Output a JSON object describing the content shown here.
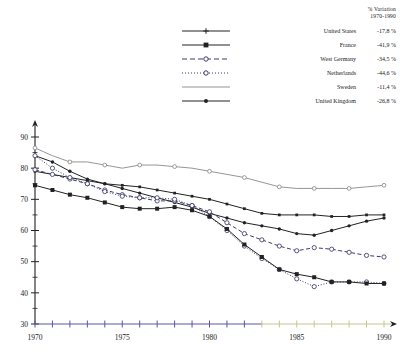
{
  "legend": {
    "header_line1": "% Variation",
    "header_line2": "1970-1990",
    "items": [
      {
        "name": "United States",
        "value": "-17,8 %",
        "style": "solid-plus",
        "color": "#222222"
      },
      {
        "name": "France",
        "value": "-41,9 %",
        "style": "solid-square",
        "color": "#222222"
      },
      {
        "name": "West Germany",
        "value": "-34,5 %",
        "style": "dashed-circle",
        "color": "#3b3b6b"
      },
      {
        "name": "Netherlands",
        "value": "-44,6 %",
        "style": "dotted-circle",
        "color": "#3b3b6b"
      },
      {
        "name": "Sweden",
        "value": "-11,4 %",
        "style": "thin-solid",
        "color": "#777777"
      },
      {
        "name": "United Kingdom",
        "value": "-26,8 %",
        "style": "solid-circle",
        "color": "#222222"
      }
    ]
  },
  "axes": {
    "y_ticks": [
      "90",
      "80",
      "70",
      "60",
      "50",
      "40",
      "30"
    ],
    "x_ticks": [
      "1970",
      "1975",
      "1980",
      "1985",
      "1990"
    ],
    "axis_color_left": "#5a57a8",
    "axis_color_right": "#c9c48a"
  },
  "chart_data": {
    "type": "line",
    "title": "",
    "xlabel": "",
    "ylabel": "",
    "xlim": [
      1970,
      1990
    ],
    "ylim": [
      30,
      90
    ],
    "grid": false,
    "legend_position": "top-right",
    "x": [
      1970,
      1971,
      1972,
      1973,
      1974,
      1975,
      1976,
      1977,
      1978,
      1979,
      1980,
      1981,
      1982,
      1983,
      1984,
      1985,
      1986,
      1987,
      1988,
      1989,
      1990
    ],
    "series": [
      {
        "name": "Sweden",
        "variation": "-11,4 %",
        "values": [
          86.5,
          84.0,
          82.0,
          82.0,
          81.0,
          80.0,
          81.0,
          81.0,
          80.5,
          80.0,
          79.0,
          78.0,
          77.0,
          75.5,
          74.0,
          73.5,
          73.5,
          73.5,
          73.5,
          74.0,
          74.5
        ]
      },
      {
        "name": "United States",
        "variation": "-17,8 %",
        "values": [
          79.0,
          78.0,
          77.0,
          76.0,
          75.0,
          74.5,
          74.0,
          73.0,
          72.0,
          71.0,
          70.0,
          68.5,
          67.0,
          65.5,
          65.0,
          65.0,
          65.0,
          64.5,
          64.5,
          65.0,
          65.0
        ]
      },
      {
        "name": "United Kingdom",
        "variation": "-26,8 %",
        "values": [
          84.0,
          82.0,
          79.0,
          76.5,
          75.0,
          73.5,
          72.0,
          70.5,
          69.0,
          67.5,
          65.5,
          64.0,
          62.5,
          61.5,
          60.5,
          59.0,
          58.5,
          60.0,
          61.5,
          63.0,
          64.0
        ]
      },
      {
        "name": "West Germany",
        "variation": "-34,5 %",
        "values": [
          79.5,
          78.0,
          76.5,
          75.0,
          73.0,
          71.5,
          70.5,
          69.5,
          69.5,
          68.0,
          66.0,
          62.5,
          59.0,
          57.0,
          55.0,
          53.5,
          54.5,
          54.0,
          53.0,
          52.0,
          51.5
        ]
      },
      {
        "name": "Netherlands",
        "variation": "-44,6 %",
        "values": [
          84.0,
          80.0,
          77.0,
          75.0,
          72.5,
          71.0,
          70.5,
          70.5,
          70.0,
          68.0,
          64.5,
          60.0,
          55.0,
          51.0,
          47.5,
          44.5,
          42.0,
          43.5,
          43.5,
          43.5,
          43.0
        ]
      },
      {
        "name": "France",
        "variation": "-41,9 %",
        "values": [
          74.5,
          73.0,
          71.5,
          70.5,
          69.0,
          67.5,
          67.0,
          67.0,
          67.5,
          66.5,
          64.5,
          60.5,
          55.5,
          51.5,
          47.5,
          46.0,
          45.0,
          43.5,
          43.5,
          43.0,
          43.0
        ]
      }
    ]
  }
}
